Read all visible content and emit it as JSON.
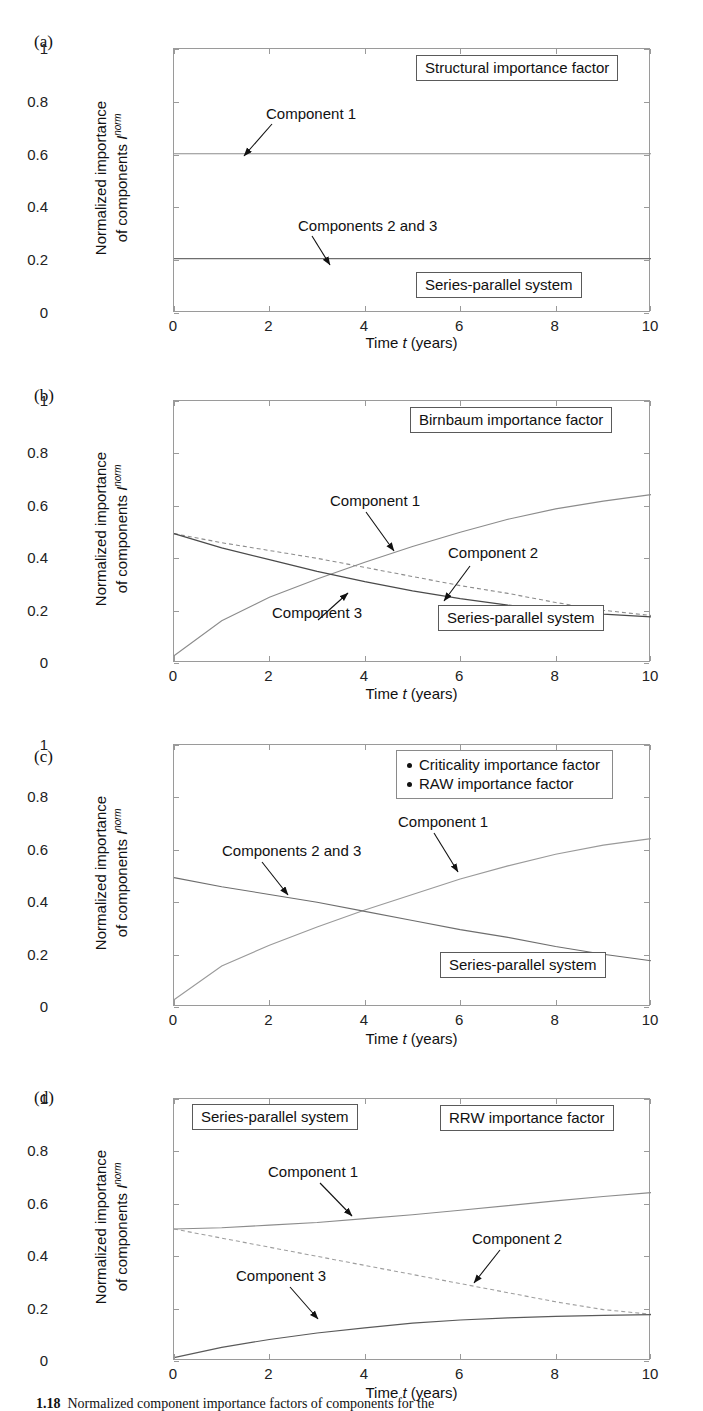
{
  "figure": {
    "caption_number": "1.18",
    "caption_text": "Normalized component importance factors of components for the",
    "axis": {
      "x_title_prefix": "Time ",
      "x_title_var": "t",
      "x_title_suffix": " (years)",
      "y_title_line1": "Normalized importance",
      "y_title_line2_prefix": "of components ",
      "y_title_var": "I",
      "y_title_sup": "norm",
      "x_ticks": [
        "0",
        "2",
        "4",
        "6",
        "8",
        "10"
      ],
      "y_ticks": [
        "0",
        "0.2",
        "0.4",
        "0.6",
        "0.8",
        "1"
      ],
      "xlim": [
        0,
        10
      ],
      "ylim": [
        0,
        1
      ]
    }
  },
  "panels": [
    {
      "label": "(a)",
      "factor_box": "Structural importance factor",
      "system_box": "Series-parallel system",
      "annotations": [
        "Component 1",
        "Components 2 and 3"
      ]
    },
    {
      "label": "(b)",
      "factor_box": "Birnbaum importance factor",
      "system_box": "Series-parallel system",
      "annotations": [
        "Component 1",
        "Component 2",
        "Component 3"
      ]
    },
    {
      "label": "(c)",
      "legend": [
        "Criticality importance factor",
        "RAW importance factor"
      ],
      "system_box": "Series-parallel system",
      "annotations": [
        "Components 2 and 3",
        "Component 1"
      ]
    },
    {
      "label": "(d)",
      "factor_box": "RRW importance factor",
      "system_box": "Series-parallel system",
      "annotations": [
        "Component 1",
        "Component 2",
        "Component 3"
      ]
    }
  ],
  "chart_data": [
    {
      "type": "line",
      "title": "Structural importance factor",
      "subtitle": "Series-parallel system",
      "xlabel": "Time t (years)",
      "ylabel": "Normalized importance of components I^norm",
      "xlim": [
        0,
        10
      ],
      "ylim": [
        0,
        1
      ],
      "grid": false,
      "legend_position": "none",
      "x": [
        0,
        1,
        2,
        3,
        4,
        5,
        6,
        7,
        8,
        9,
        10
      ],
      "series": [
        {
          "name": "Component 1",
          "style": "solid",
          "values": [
            0.6,
            0.6,
            0.6,
            0.6,
            0.6,
            0.6,
            0.6,
            0.6,
            0.6,
            0.6,
            0.6
          ]
        },
        {
          "name": "Components 2 and 3",
          "style": "solid",
          "values": [
            0.2,
            0.2,
            0.2,
            0.2,
            0.2,
            0.2,
            0.2,
            0.2,
            0.2,
            0.2,
            0.2
          ]
        }
      ]
    },
    {
      "type": "line",
      "title": "Birnbaum importance factor",
      "subtitle": "Series-parallel system",
      "xlabel": "Time t (years)",
      "ylabel": "Normalized importance of components I^norm",
      "xlim": [
        0,
        10
      ],
      "ylim": [
        0,
        1
      ],
      "grid": false,
      "legend_position": "none",
      "x": [
        0,
        1,
        2,
        3,
        4,
        5,
        6,
        7,
        8,
        9,
        10
      ],
      "series": [
        {
          "name": "Component 1",
          "style": "solid",
          "values": [
            0.02,
            0.155,
            0.245,
            0.315,
            0.38,
            0.44,
            0.495,
            0.545,
            0.585,
            0.615,
            0.64
          ]
        },
        {
          "name": "Component 2",
          "style": "dashed",
          "values": [
            0.49,
            0.455,
            0.425,
            0.395,
            0.36,
            0.325,
            0.29,
            0.26,
            0.225,
            0.195,
            0.175
          ]
        },
        {
          "name": "Component 3",
          "style": "solid",
          "values": [
            0.49,
            0.435,
            0.39,
            0.345,
            0.305,
            0.27,
            0.24,
            0.215,
            0.195,
            0.18,
            0.17
          ]
        }
      ]
    },
    {
      "type": "line",
      "title": "Criticality importance factor / RAW importance factor",
      "subtitle": "Series-parallel system",
      "xlabel": "Time t (years)",
      "ylabel": "Normalized importance of components I^norm",
      "xlim": [
        0,
        10
      ],
      "ylim": [
        0,
        1
      ],
      "grid": false,
      "legend_position": "top-right",
      "x": [
        0,
        1,
        2,
        3,
        4,
        5,
        6,
        7,
        8,
        9,
        10
      ],
      "series": [
        {
          "name": "Component 1",
          "style": "solid",
          "values": [
            0.02,
            0.15,
            0.23,
            0.3,
            0.365,
            0.425,
            0.485,
            0.535,
            0.58,
            0.615,
            0.64
          ]
        },
        {
          "name": "Components 2 and 3",
          "style": "solid",
          "values": [
            0.49,
            0.455,
            0.425,
            0.395,
            0.36,
            0.325,
            0.29,
            0.26,
            0.225,
            0.195,
            0.17
          ]
        }
      ]
    },
    {
      "type": "line",
      "title": "RRW importance factor",
      "subtitle": "Series-parallel system",
      "xlabel": "Time t (years)",
      "ylabel": "Normalized importance of components I^norm",
      "xlim": [
        0,
        10
      ],
      "ylim": [
        0,
        1
      ],
      "grid": false,
      "legend_position": "none",
      "x": [
        0,
        1,
        2,
        3,
        4,
        5,
        6,
        7,
        8,
        9,
        10
      ],
      "series": [
        {
          "name": "Component 1",
          "style": "solid",
          "values": [
            0.5,
            0.505,
            0.515,
            0.525,
            0.54,
            0.555,
            0.572,
            0.59,
            0.608,
            0.625,
            0.64
          ]
        },
        {
          "name": "Component 2",
          "style": "dashed",
          "values": [
            0.5,
            0.465,
            0.43,
            0.395,
            0.36,
            0.325,
            0.29,
            0.255,
            0.22,
            0.19,
            0.172
          ]
        },
        {
          "name": "Component 3",
          "style": "solid",
          "values": [
            0.005,
            0.045,
            0.075,
            0.1,
            0.12,
            0.138,
            0.15,
            0.158,
            0.164,
            0.168,
            0.171
          ]
        }
      ]
    }
  ]
}
